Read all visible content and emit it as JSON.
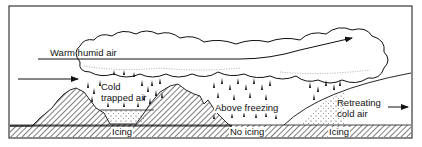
{
  "diagram": {
    "colors": {
      "ink": "#111111",
      "background": "#ffffff",
      "hatch": "#222222"
    },
    "labels": {
      "warm_humid_air": "Warm humid air",
      "cold_trapped_air_line1": "Cold",
      "cold_trapped_air_line2": "trapped air",
      "above_freezing": "Above freezing",
      "retreating_line1": "Retreating",
      "retreating_line2": "cold air",
      "icing_left": "Icing",
      "no_icing": "No icing",
      "icing_right": "Icing"
    },
    "elements": {
      "cloud": "cumulus cloud layer",
      "arrow_warm_air": "arrow-right",
      "arrow_inflow": "arrow-right",
      "arrow_retreat": "arrow-right",
      "terrain": "hatched mountains and ground",
      "rain": "raindrops"
    }
  }
}
